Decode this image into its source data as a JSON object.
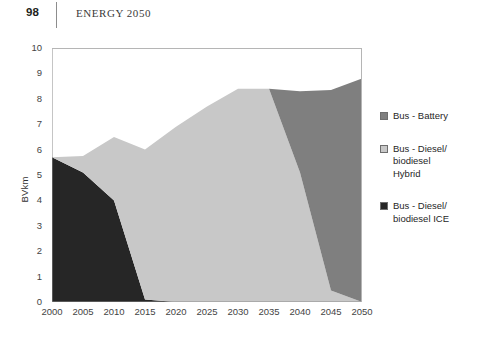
{
  "page": {
    "folio": "98",
    "running_title": "ENERGY 2050"
  },
  "chart_data": {
    "type": "area",
    "stacked": true,
    "title": "",
    "subtitle": "",
    "xlabel": "",
    "ylabel": "BVkm",
    "xlim": [
      2000,
      2050
    ],
    "ylim": [
      0,
      10
    ],
    "ytick_step": 1,
    "xtick_step": 5,
    "grid": false,
    "legend_position": "right",
    "x": [
      2000,
      2005,
      2010,
      2015,
      2020,
      2025,
      2030,
      2035,
      2040,
      2045,
      2050
    ],
    "xtick_labels": [
      "2000",
      "2005",
      "2010",
      "2015",
      "2020",
      "2025",
      "2030",
      "2035",
      "2040",
      "2045",
      "2050"
    ],
    "ytick_labels": [
      "0",
      "1",
      "2",
      "3",
      "4",
      "5",
      "6",
      "7",
      "8",
      "9",
      "10"
    ],
    "series": [
      {
        "name": "Bus - Battery",
        "color": "#7f7f7f",
        "order": "top",
        "values": [
          0,
          0,
          0,
          0,
          0,
          0,
          0,
          0,
          3.2,
          7.9,
          8.8
        ]
      },
      {
        "name": "Bus - Diesel/\nbiodiesel\nHybrid",
        "color": "#c8c8c8",
        "order": "middle",
        "values": [
          0,
          0.65,
          2.5,
          5.9,
          6.9,
          7.7,
          8.4,
          8.4,
          5.1,
          0.45,
          0
        ]
      },
      {
        "name": "Bus - Diesel/\nbiodiesel ICE",
        "color": "#262626",
        "order": "bottom",
        "values": [
          5.7,
          5.1,
          4.0,
          0.1,
          0,
          0,
          0,
          0,
          0,
          0,
          0
        ]
      }
    ],
    "totals": [
      5.7,
      5.75,
      6.5,
      6.0,
      6.9,
      7.7,
      8.4,
      8.4,
      8.3,
      8.35,
      8.8
    ]
  },
  "legend": {
    "items": [
      {
        "label": "Bus - Battery",
        "color": "#7f7f7f"
      },
      {
        "label": "Bus - Diesel/\nbiodiesel\nHybrid",
        "color": "#c8c8c8"
      },
      {
        "label": "Bus - Diesel/\nbiodiesel ICE",
        "color": "#262626"
      }
    ]
  }
}
